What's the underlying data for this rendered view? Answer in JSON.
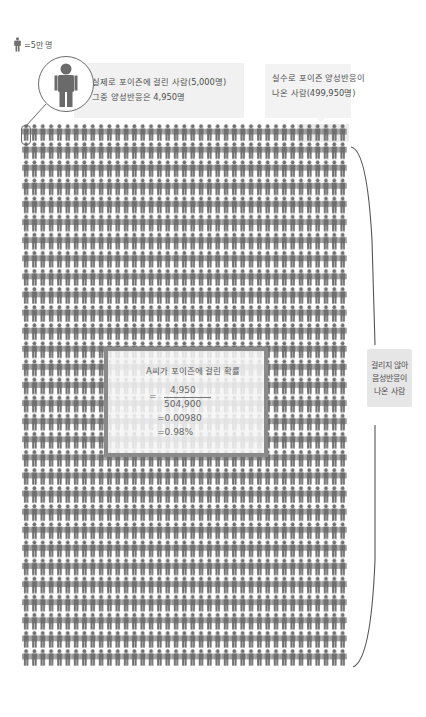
{
  "legend": {
    "icon": "person-icon",
    "text": "=5만 명"
  },
  "callouts": {
    "infected": {
      "line1": "실제로 포이즌에 걸린 사람(5,000명)",
      "line2": "그중 양성반응은 4,950명"
    },
    "false_positive": {
      "line1": "실수로 포이즌 양성반응이",
      "line2": "나온 사람(499,950명)"
    },
    "true_negative": {
      "line1": "걸리지 않아",
      "line2": "음성반응이",
      "line3": "나온 사람"
    }
  },
  "formula": {
    "title": "A씨가 포이즌에 걸린 확률",
    "equals": "=",
    "numerator": "4,950",
    "denominator": "504,900",
    "decimal": "=0.00980",
    "percent": "=0.98%"
  },
  "grid": {
    "columns": 39,
    "rows": 30,
    "icon": "person-icon",
    "icon_color": "#6f6f6f",
    "highlight_color": "#e6e6e6"
  },
  "colors": {
    "icon": "#6f6f6f",
    "banner_left": "#f1f1f1",
    "banner_right": "#f3f3f3",
    "box_border": "#8a8a8a",
    "side_label_bg": "#e6e6e6"
  }
}
